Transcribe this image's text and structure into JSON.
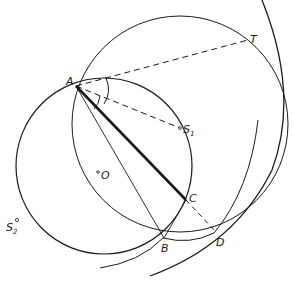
{
  "diagram": {
    "type": "geometric construction",
    "stroke_color": "#1a1a1a",
    "background": "#ffffff",
    "points": {
      "A": {
        "label": "A",
        "x": 76,
        "y": 86
      },
      "T": {
        "label": "T",
        "x": 248,
        "y": 40
      },
      "S1": {
        "label": "S",
        "sub": "1",
        "x": 180,
        "y": 128
      },
      "O": {
        "label": "O",
        "x": 103,
        "y": 175
      },
      "S2": {
        "label": "S",
        "sub": "2",
        "x": 17,
        "y": 221
      },
      "C": {
        "label": "C",
        "x": 186,
        "y": 200
      },
      "B": {
        "label": "B",
        "x": 164,
        "y": 238
      },
      "D": {
        "label": "D",
        "x": 216,
        "y": 232
      }
    },
    "elements": [
      "circle centered at O through A, B, C, S1, S2",
      "large circle through A, T, D",
      "outer arc on right",
      "arc through B and D",
      "dashed segments A-T, A-S1, C-D",
      "thick segment A-C",
      "thin segments A-B, B-C",
      "angle arcs at A"
    ]
  }
}
